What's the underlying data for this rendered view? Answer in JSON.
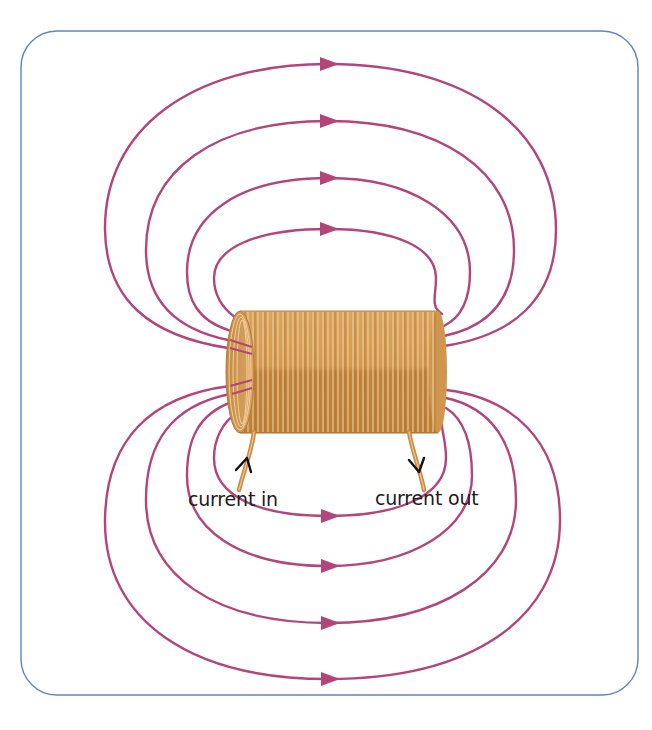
{
  "diagram": {
    "colors": {
      "frame_border": "#5b86c4",
      "field_line": "#b3457a",
      "coil_light": "#d9a15e",
      "coil_dark": "#b57a34",
      "coil_wire_highlight": "#f0c995",
      "label_text": "#1c1c1c",
      "arrow_mark": "#111111"
    },
    "labels": {
      "current_in": "current in",
      "current_out": "current out"
    },
    "field_lines": {
      "top_count": 4,
      "bottom_count": 4,
      "direction": "left-to-right along outer loops (arrows point right)",
      "top_arrow_y": [
        64,
        121,
        178,
        229
      ],
      "bottom_arrow_y": [
        516,
        566,
        623,
        679
      ]
    },
    "coil": {
      "x": 225,
      "y": 312,
      "width": 220,
      "height": 120,
      "turns": 38
    }
  }
}
